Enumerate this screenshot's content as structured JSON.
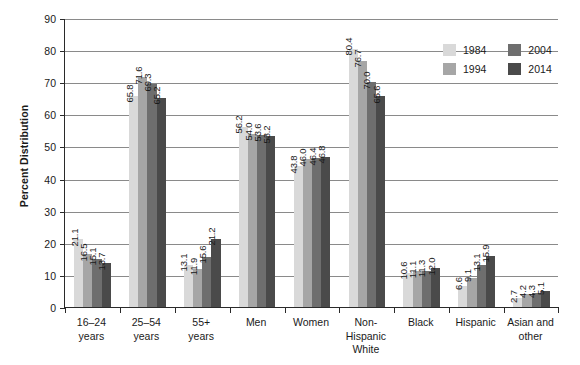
{
  "chart_data": {
    "type": "bar",
    "title": "",
    "subtitle": "",
    "xlabel": "",
    "ylabel": "Percent Distribution",
    "ylim": [
      0,
      90
    ],
    "ytick_step": 10,
    "yticks": [
      0,
      10,
      20,
      30,
      40,
      50,
      60,
      70,
      80,
      90
    ],
    "grid": true,
    "legend_position": "top-right",
    "categories": [
      "16–24 years",
      "25–54 years",
      "55+ years",
      "Men",
      "Women",
      "Non-Hispanic White",
      "Black",
      "Hispanic",
      "Asian and other"
    ],
    "category_lines": [
      [
        "16–24",
        "years"
      ],
      [
        "25–54",
        "years"
      ],
      [
        "55+",
        "years"
      ],
      [
        "Men"
      ],
      [
        "Women"
      ],
      [
        "Non-",
        "Hispanic",
        "White"
      ],
      [
        "Black"
      ],
      [
        "Hispanic"
      ],
      [
        "Asian and",
        "other"
      ]
    ],
    "series": [
      {
        "name": "1984",
        "color": "#d9d9d9",
        "values": [
          21.1,
          65.8,
          13.1,
          56.2,
          43.8,
          80.4,
          10.6,
          6.6,
          2.7
        ]
      },
      {
        "name": "1994",
        "color": "#a6a6a6",
        "values": [
          16.5,
          71.6,
          11.9,
          54.0,
          46.0,
          76.7,
          11.1,
          9.1,
          4.2
        ]
      },
      {
        "name": "2004",
        "color": "#6e6e6e",
        "values": [
          15.1,
          69.3,
          15.6,
          53.6,
          46.4,
          70.0,
          11.3,
          13.1,
          4.3
        ]
      },
      {
        "name": "2014",
        "color": "#4a4a4a",
        "values": [
          13.7,
          65.2,
          21.2,
          53.2,
          46.8,
          65.6,
          12.0,
          15.9,
          5.1
        ]
      }
    ],
    "value_labels": [
      [
        "21.1",
        "16.5",
        "15.1",
        "13.7"
      ],
      [
        "65.8",
        "71.6",
        "69.3",
        "65.2"
      ],
      [
        "13.1",
        "11.9",
        "15.6",
        "21.2"
      ],
      [
        "56.2",
        "54.0",
        "53.6",
        "53.2"
      ],
      [
        "43.8",
        "46.0",
        "46.4",
        "46.8"
      ],
      [
        "80.4",
        "76.7",
        "70.0",
        "65.6"
      ],
      [
        "10.6",
        "11.1",
        "11.3",
        "12.0"
      ],
      [
        "6.6",
        "9.1",
        "13.1",
        "15.9"
      ],
      [
        "2.7",
        "4.2",
        "4.3",
        "5.1"
      ]
    ]
  },
  "legend": {
    "entries": [
      {
        "label": "1984",
        "color": "#d9d9d9"
      },
      {
        "label": "2004",
        "color": "#6e6e6e"
      },
      {
        "label": "1994",
        "color": "#a6a6a6"
      },
      {
        "label": "2014",
        "color": "#4a4a4a"
      }
    ]
  },
  "axis": {
    "y_title": "Percent Distribution",
    "y_tick_labels": [
      "0",
      "10",
      "20",
      "30",
      "40",
      "50",
      "60",
      "70",
      "80",
      "90"
    ]
  }
}
